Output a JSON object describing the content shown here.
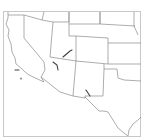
{
  "map": {
    "region": "Southwestern United States",
    "background_color": "#ffffff",
    "border_color": "#c8c8c8",
    "state_line_color": "#8a8a8a",
    "feature_color": "#404040",
    "states": [
      "California",
      "Nevada",
      "Utah",
      "Arizona",
      "Colorado",
      "New Mexico",
      "Texas",
      "Oregon",
      "Idaho",
      "Wyoming",
      "Nebraska",
      "Kansas",
      "Oklahoma"
    ]
  }
}
